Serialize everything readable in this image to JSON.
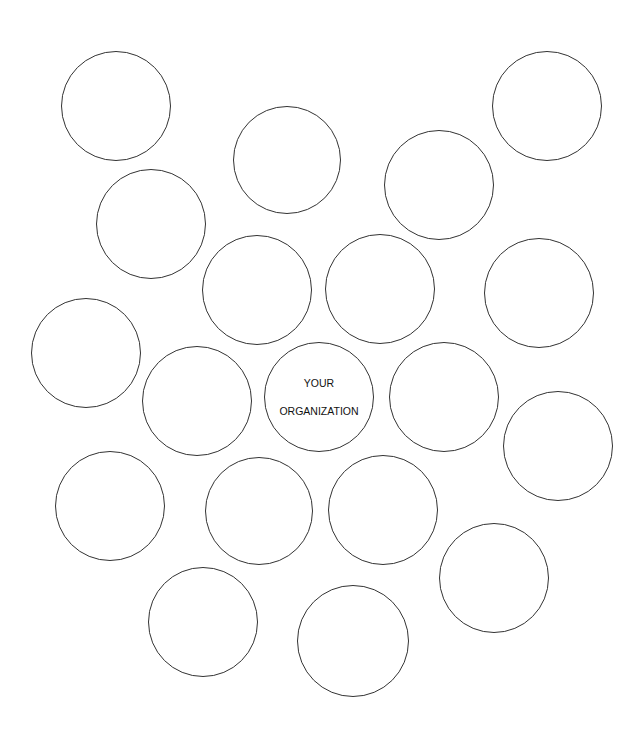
{
  "diagram": {
    "center": {
      "line1": "YOUR",
      "line2": "ORGANIZATION",
      "cx": 319,
      "cy": 397,
      "r": 55
    },
    "stroke_color": "#333333",
    "bubbles": [
      {
        "cx": 116,
        "cy": 106,
        "r": 55
      },
      {
        "cx": 547,
        "cy": 106,
        "r": 55
      },
      {
        "cx": 287,
        "cy": 160,
        "r": 54
      },
      {
        "cx": 439,
        "cy": 185,
        "r": 55
      },
      {
        "cx": 151,
        "cy": 224,
        "r": 55
      },
      {
        "cx": 257,
        "cy": 290,
        "r": 55
      },
      {
        "cx": 380,
        "cy": 289,
        "r": 55
      },
      {
        "cx": 539,
        "cy": 293,
        "r": 55
      },
      {
        "cx": 86,
        "cy": 353,
        "r": 55
      },
      {
        "cx": 197,
        "cy": 401,
        "r": 55
      },
      {
        "cx": 444,
        "cy": 397,
        "r": 55
      },
      {
        "cx": 558,
        "cy": 446,
        "r": 55
      },
      {
        "cx": 110,
        "cy": 506,
        "r": 55
      },
      {
        "cx": 259,
        "cy": 511,
        "r": 54
      },
      {
        "cx": 383,
        "cy": 510,
        "r": 55
      },
      {
        "cx": 494,
        "cy": 578,
        "r": 55
      },
      {
        "cx": 203,
        "cy": 622,
        "r": 55
      },
      {
        "cx": 353,
        "cy": 641,
        "r": 56
      }
    ]
  }
}
